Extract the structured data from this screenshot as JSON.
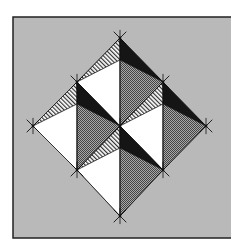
{
  "figure": {
    "frame": {
      "x": 13,
      "y": 17,
      "width": 222,
      "height": 221,
      "fill": "#b9b9b9",
      "stroke": "#222222"
    },
    "colors": {
      "white": "#ffffff",
      "black": "#151515",
      "checker_dark": "#444444",
      "checker_light": "#a8a8a8",
      "stripe_dark": "#333333",
      "stripe_light": "#ffffff",
      "line": "#111111"
    },
    "quadrants": [
      {
        "name": "top",
        "top": [
          120,
          38
        ],
        "left": [
          77,
          82
        ],
        "bottom": [
          120,
          126
        ],
        "right": [
          163,
          82
        ]
      },
      {
        "name": "left",
        "top": [
          77,
          82
        ],
        "left": [
          33,
          126
        ],
        "bottom": [
          77,
          170
        ],
        "right": [
          120,
          126
        ]
      },
      {
        "name": "right",
        "top": [
          163,
          82
        ],
        "left": [
          120,
          126
        ],
        "bottom": [
          163,
          170
        ],
        "right": [
          206,
          126
        ]
      },
      {
        "name": "bottom",
        "top": [
          120,
          126
        ],
        "left": [
          77,
          170
        ],
        "bottom": [
          120,
          216
        ],
        "right": [
          163,
          170
        ]
      }
    ],
    "split_offset": 22,
    "vertices": [
      [
        120,
        38
      ],
      [
        77,
        82
      ],
      [
        163,
        82
      ],
      [
        33,
        126
      ],
      [
        120,
        126
      ],
      [
        206,
        126
      ],
      [
        77,
        170
      ],
      [
        163,
        170
      ],
      [
        120,
        216
      ]
    ],
    "tick_length": 9
  }
}
